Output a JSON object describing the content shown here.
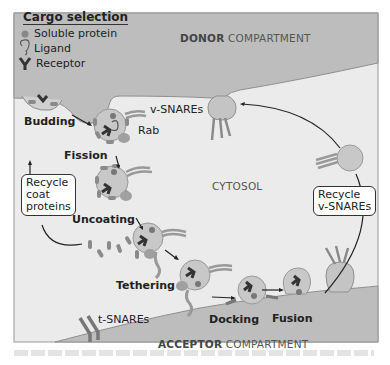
{
  "legend": {
    "title": "Cargo selection",
    "items": [
      {
        "icon": "soluble-protein-dot",
        "label": "Soluble protein"
      },
      {
        "icon": "ligand-glyph",
        "label": "Ligand"
      },
      {
        "icon": "receptor-glyph",
        "label": "Receptor"
      }
    ]
  },
  "compartments": {
    "donor": {
      "bold": "DONOR",
      "rest": " COMPARTMENT"
    },
    "cytosol": "CYTOSOL",
    "acceptor": {
      "bold": "ACCEPTOR",
      "rest": " COMPARTMENT"
    }
  },
  "steps": {
    "budding": "Budding",
    "fission": "Fission",
    "uncoating": "Uncoating",
    "tethering": "Tethering",
    "docking": "Docking",
    "fusion": "Fusion"
  },
  "labels": {
    "v_snares": "v-SNAREs",
    "rab": "Rab",
    "t_snares": "t-SNAREs"
  },
  "boxes": {
    "recycle_coat": [
      "Recycle",
      "coat",
      "proteins"
    ],
    "recycle_vsnares": [
      "Recycle",
      "v-SNAREs"
    ]
  },
  "colors": {
    "compartment": "#bdbdbd",
    "cytosol": "#ebebeb",
    "vesicle": "#c8c8c8",
    "coat": "#8a8a8a",
    "snare": "#9a9a9a",
    "dark": "#333333"
  }
}
